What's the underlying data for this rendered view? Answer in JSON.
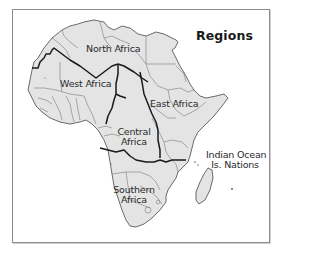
{
  "map": {
    "title": "Regions",
    "colors": {
      "land": "#e4e4e4",
      "region_border": "#1a1a1a",
      "country_border": "#6e6e6e",
      "frame": "#8c8c8c",
      "background": "#ffffff"
    },
    "regions": [
      {
        "id": "north-africa",
        "label": "North Africa"
      },
      {
        "id": "west-africa",
        "label": "West Africa"
      },
      {
        "id": "east-africa",
        "label": "East Africa"
      },
      {
        "id": "central-africa",
        "label_lines": [
          "Central",
          "Africa"
        ]
      },
      {
        "id": "southern-africa",
        "label_lines": [
          "Southern",
          "Africa"
        ]
      },
      {
        "id": "indian-ocean",
        "label_lines": [
          "Indian Ocean",
          "Is. Nations"
        ]
      }
    ]
  }
}
